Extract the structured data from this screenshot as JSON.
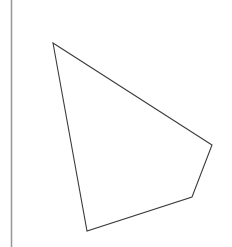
{
  "figure": {
    "canvas": {
      "width": 232,
      "height": 247,
      "background_color": "#ffffff"
    },
    "axis_rule": {
      "name": "vertical-axis-rule",
      "x": 11.5,
      "y_start": 0,
      "y_end": 247,
      "color": "#9a9a9a",
      "stroke_width": 1.6
    },
    "polygon": {
      "name": "quadrilateral",
      "sides": 4,
      "fill": "none",
      "stroke_color": "#3b3b3b",
      "stroke_width": 1.1,
      "points_attr": "53,43 212,145 192,197 87,231",
      "vertices": [
        {
          "label": "top",
          "x": 53,
          "y": 43
        },
        {
          "label": "right",
          "x": 212,
          "y": 145
        },
        {
          "label": "bottom-right",
          "x": 192,
          "y": 197
        },
        {
          "label": "bottom-left",
          "x": 87,
          "y": 231
        }
      ]
    }
  },
  "chart_data": {
    "type": "scatter",
    "title": "",
    "subtitle": "",
    "xlabel": "",
    "ylabel": "",
    "grid": false,
    "legend": false,
    "xlim": [
      0,
      232
    ],
    "ylim": [
      0,
      247
    ],
    "tick_labels_x": [],
    "tick_labels_y": [],
    "annotations": [],
    "series": [
      {
        "name": "quadrilateral-outline",
        "type": "polygon",
        "closed": true,
        "fill": "none",
        "stroke": "#3b3b3b",
        "x": [
          53,
          212,
          192,
          87
        ],
        "y": [
          43,
          145,
          197,
          231
        ]
      },
      {
        "name": "vertical-axis-rule",
        "type": "line",
        "closed": false,
        "stroke": "#9a9a9a",
        "x": [
          11.5,
          11.5
        ],
        "y": [
          0,
          247
        ]
      }
    ]
  }
}
